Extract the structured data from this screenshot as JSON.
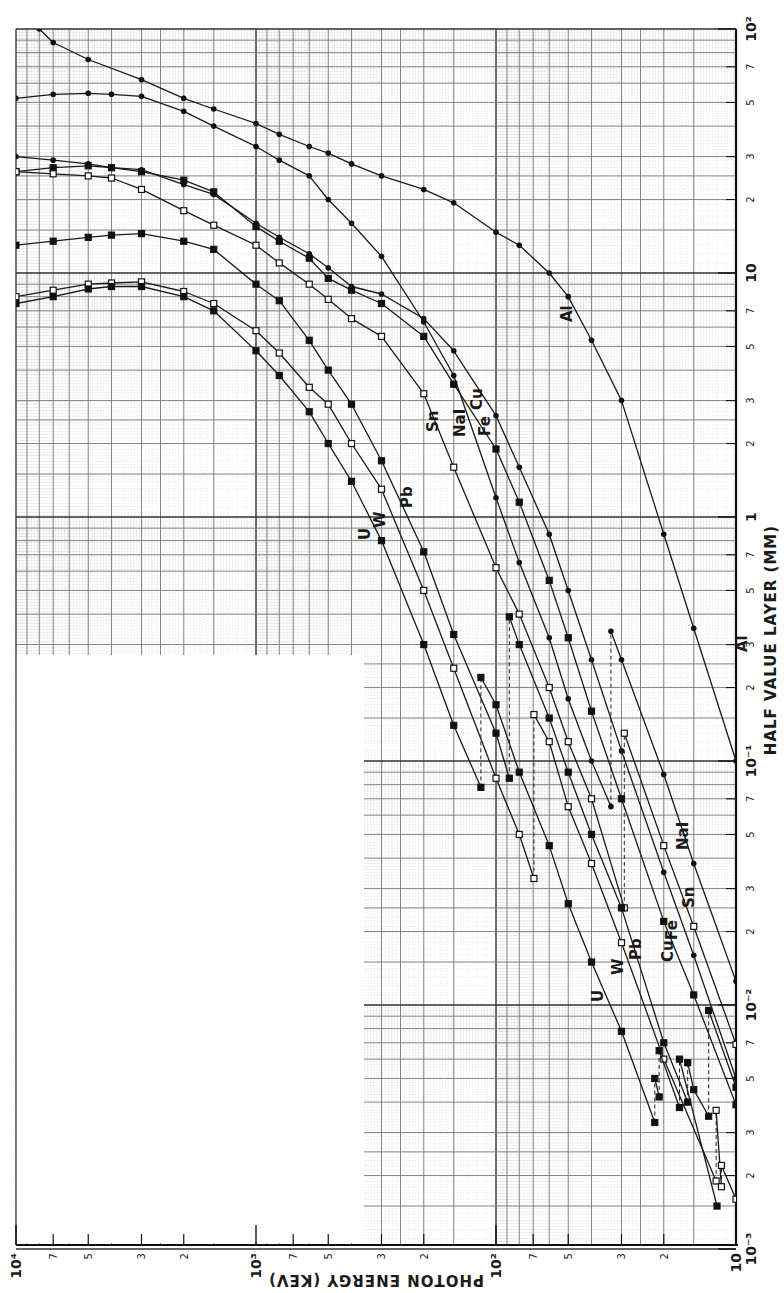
{
  "chart_data": {
    "type": "line",
    "title": "",
    "xlabel": "PHOTON ENERGY (KEV)",
    "ylabel": "HALF VALUE LAYER (MM)",
    "xscale": "log",
    "yscale": "log",
    "xlim": [
      10,
      10000
    ],
    "ylim": [
      0.001,
      100
    ],
    "x_direction": "reversed (10^4 at left, 10 at right), figure printed rotated",
    "grid": true,
    "x_major_ticks": [
      "10⁴",
      "10³",
      "10²",
      "10"
    ],
    "x_minor_ticks": [
      "7",
      "5",
      "3",
      "2"
    ],
    "y_major_ticks": [
      "10⁻³",
      "10⁻²",
      "10⁻¹",
      "1",
      "10",
      "10²"
    ],
    "y_minor_ticks": [
      "2",
      "3",
      "5",
      "7"
    ],
    "legend": "inline curve labels",
    "series": [
      {
        "name": "Al",
        "marker": "dot",
        "x": [
          8000,
          7000,
          5000,
          3000,
          2000,
          1500,
          1000,
          800,
          600,
          500,
          400,
          300,
          200,
          150,
          100,
          80,
          60,
          50,
          40,
          30,
          20,
          15,
          10
        ],
        "y": [
          100,
          88,
          75,
          62,
          52,
          47,
          41,
          37,
          33,
          31,
          28,
          25,
          22,
          19.4,
          14.7,
          13,
          10,
          8,
          5.3,
          3,
          0.85,
          0.35,
          0.1
        ]
      },
      {
        "name": "NaI",
        "marker": "dot",
        "x": [
          10000,
          7000,
          5000,
          4000,
          3000,
          2000,
          1500,
          1000,
          800,
          600,
          500,
          400,
          300,
          200,
          150,
          100,
          80,
          60,
          50,
          40,
          33.2,
          33.2,
          30,
          20,
          15,
          10
        ],
        "y": [
          52,
          54,
          54.5,
          54,
          53,
          46,
          40,
          33,
          29,
          25,
          20,
          16,
          11.7,
          6.3,
          3.8,
          1.2,
          0.65,
          0.32,
          0.18,
          0.1,
          0.065,
          0.34,
          0.26,
          0.088,
          0.038,
          0.0125
        ]
      },
      {
        "name": "Fe",
        "marker": "dot",
        "x": [
          10000,
          7000,
          5000,
          4000,
          3000,
          2000,
          1500,
          1000,
          800,
          600,
          500,
          400,
          300,
          200,
          150,
          100,
          80,
          60,
          50,
          40,
          30,
          20,
          15,
          10
        ],
        "y": [
          30,
          29,
          28,
          27,
          26.5,
          23,
          21,
          16,
          14,
          12,
          10.5,
          8.8,
          8.2,
          6.5,
          4.8,
          2.6,
          1.6,
          0.85,
          0.5,
          0.26,
          0.11,
          0.035,
          0.016,
          0.005
        ]
      },
      {
        "name": "Cu",
        "marker": "square",
        "x": [
          10000,
          7000,
          5000,
          4000,
          3000,
          2000,
          1500,
          1000,
          800,
          600,
          500,
          400,
          300,
          200,
          150,
          100,
          80,
          60,
          50,
          40,
          30,
          20,
          15,
          10
        ],
        "y": [
          26,
          27,
          27.5,
          27,
          26,
          24,
          21.5,
          15.5,
          13.5,
          11.5,
          9.5,
          8.5,
          7.5,
          5.5,
          3.5,
          1.9,
          1.15,
          0.55,
          0.32,
          0.16,
          0.07,
          0.022,
          0.011,
          0.0039
        ]
      },
      {
        "name": "Sn",
        "marker": "square",
        "x": [
          10000,
          7000,
          5000,
          4000,
          3000,
          2000,
          1500,
          1000,
          800,
          600,
          500,
          400,
          300,
          200,
          150,
          100,
          80,
          60,
          50,
          40,
          29.2,
          29.2,
          20,
          15,
          10
        ],
        "y": [
          26,
          25.5,
          25,
          24.5,
          22,
          18,
          15.7,
          13,
          11,
          9,
          7.8,
          6.5,
          5.5,
          3.2,
          1.6,
          0.62,
          0.4,
          0.2,
          0.12,
          0.07,
          0.025,
          0.13,
          0.045,
          0.021,
          0.0069
        ]
      },
      {
        "name": "Pb",
        "marker": "square",
        "x": [
          10000,
          7000,
          5000,
          4000,
          3000,
          2000,
          1500,
          1000,
          800,
          600,
          500,
          400,
          300,
          200,
          150,
          100,
          88,
          88,
          80,
          60,
          50,
          40,
          30,
          20,
          15.9,
          15.9,
          15,
          13,
          13,
          10
        ],
        "y": [
          13,
          13.5,
          14,
          14.3,
          14.5,
          13.5,
          12.5,
          9,
          7.7,
          5.3,
          4,
          2.9,
          1.7,
          0.72,
          0.33,
          0.13,
          0.085,
          0.39,
          0.3,
          0.15,
          0.09,
          0.05,
          0.025,
          0.007,
          0.004,
          0.0058,
          0.0045,
          0.0035,
          0.0095,
          0.0046
        ]
      },
      {
        "name": "W",
        "marker": "square",
        "x": [
          10000,
          7000,
          5000,
          4000,
          3000,
          2000,
          1500,
          1000,
          800,
          600,
          500,
          400,
          300,
          200,
          150,
          100,
          80,
          69.5,
          69.5,
          60,
          50,
          40,
          30,
          20,
          12.1,
          12.1,
          11.5,
          11.5,
          10
        ],
        "y": [
          8,
          8.5,
          9,
          9.1,
          9.2,
          8.4,
          7.5,
          5.8,
          4.7,
          3.4,
          2.9,
          2.0,
          1.3,
          0.5,
          0.24,
          0.085,
          0.05,
          0.033,
          0.155,
          0.12,
          0.065,
          0.038,
          0.018,
          0.006,
          0.0019,
          0.0037,
          0.0018,
          0.0022,
          0.0016
        ]
      },
      {
        "name": "U",
        "marker": "square",
        "x": [
          10000,
          7000,
          5000,
          4000,
          3000,
          2000,
          1500,
          1000,
          800,
          600,
          500,
          400,
          300,
          200,
          150,
          115.6,
          115.6,
          100,
          80,
          60,
          50,
          40,
          30,
          21.8,
          21.8,
          20.9,
          20.9,
          17.2,
          17.2,
          12
        ],
        "y": [
          7.5,
          8,
          8.6,
          8.8,
          8.8,
          8,
          7,
          4.8,
          3.8,
          2.7,
          2,
          1.4,
          0.8,
          0.3,
          0.14,
          0.078,
          0.22,
          0.17,
          0.09,
          0.045,
          0.026,
          0.015,
          0.0078,
          0.0033,
          0.005,
          0.0042,
          0.0065,
          0.0038,
          0.006,
          0.0015
        ]
      }
    ],
    "annotations": [
      "Al",
      "NaI",
      "Fe",
      "Cu",
      "Sn",
      "Pb",
      "W",
      "U"
    ]
  },
  "labels": {
    "x_axis_title": "PHOTON ENERGY (KEV)",
    "y_axis_title": "HALF VALUE LAYER (MM)"
  }
}
